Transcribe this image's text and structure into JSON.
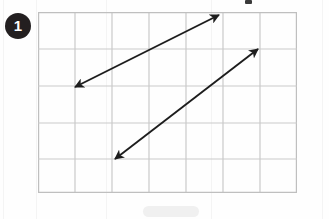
{
  "page": {
    "width": 329,
    "height": 219,
    "background_color": "#fefefe"
  },
  "badge": {
    "label": "1",
    "fill_color": "#231f20",
    "text_color": "#ffffff",
    "shape": "circle"
  },
  "grid": {
    "columns": 7,
    "rows": 5,
    "origin_x": 38,
    "origin_y": 12,
    "cell_width": 37,
    "cell_height": 36.2,
    "line_color": "#c9c9c9",
    "border_color": "#bfbfbf",
    "line_width": 1.2
  },
  "diagram": {
    "type": "parallel-line-segments",
    "stroke_color": "#1d1d1d",
    "stroke_width": 1.9,
    "arrows": [
      {
        "name": "upper-double-arrow",
        "x1": 75,
        "y1": 87,
        "x2": 219,
        "y2": 15,
        "heads": "both",
        "slope_cells": "3 up over 4 across"
      },
      {
        "name": "lower-double-arrow",
        "x1": 115,
        "y1": 159,
        "x2": 258,
        "y2": 49,
        "heads": "both",
        "slope_cells": "3 up over 4 across"
      }
    ]
  },
  "artifacts": {
    "top_fragment": {
      "x": 245,
      "y": 0,
      "width": 7,
      "height": 4
    },
    "bottom_smudge": {
      "x": 143,
      "y": 206,
      "width": 56,
      "height": 11
    },
    "streaks": [
      3,
      36,
      106,
      211,
      322
    ]
  }
}
